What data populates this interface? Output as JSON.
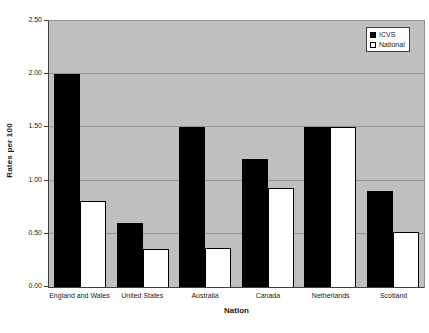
{
  "chart_data": {
    "type": "bar",
    "title": "",
    "xlabel": "Nation",
    "ylabel": "Rates per 100",
    "ylim": [
      0,
      2.5
    ],
    "ytick_step": 0.5,
    "ytick_format_decimals": 2,
    "grid": true,
    "legend_position": "top-right",
    "categories": [
      "England and Wales",
      "United States",
      "Australia",
      "Canada",
      "Netherlands",
      "Scotland"
    ],
    "series": [
      {
        "name": "ICVS",
        "fill": "#000000",
        "border": "#000000",
        "values": [
          2.0,
          0.6,
          1.5,
          1.2,
          1.5,
          0.9
        ]
      },
      {
        "name": "National",
        "fill": "#ffffff",
        "border": "#000000",
        "values": [
          0.81,
          0.36,
          0.37,
          0.93,
          1.5,
          0.52
        ]
      }
    ],
    "colors": {
      "page_background": "#ffffff",
      "plot_background": "#bfbfbf",
      "gridline": "#949494",
      "axis_line": "#404040",
      "text": "#1a1a1a"
    }
  }
}
